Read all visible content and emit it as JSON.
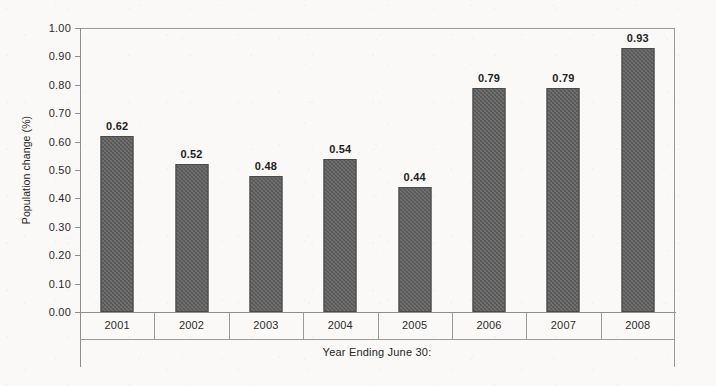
{
  "chart_data": {
    "type": "bar",
    "title": "",
    "xlabel": "Year Ending June 30:",
    "ylabel": "Population change (%)",
    "categories": [
      "2001",
      "2002",
      "2003",
      "2004",
      "2005",
      "2006",
      "2007",
      "2008"
    ],
    "values": [
      0.62,
      0.52,
      0.48,
      0.54,
      0.44,
      0.79,
      0.79,
      0.93
    ],
    "data_labels": [
      "0.62",
      "0.52",
      "0.48",
      "0.54",
      "0.44",
      "0.79",
      "0.79",
      "0.93"
    ],
    "ylim": [
      0.0,
      1.0
    ],
    "ytick_step": 0.1,
    "ytick_labels": [
      "1.00",
      "0.90",
      "0.80",
      "0.70",
      "0.60",
      "0.50",
      "0.40",
      "0.30",
      "0.20",
      "0.10",
      "0.00"
    ],
    "ytick_values": [
      1.0,
      0.9,
      0.8,
      0.7,
      0.6,
      0.5,
      0.4,
      0.3,
      0.2,
      0.1,
      0.0
    ],
    "grid": false,
    "legend": null,
    "legend_position": "none",
    "series": [
      {
        "name": "Population change",
        "values": [
          0.62,
          0.52,
          0.48,
          0.54,
          0.44,
          0.79,
          0.79,
          0.93
        ],
        "color": "#5c5c5c"
      }
    ],
    "colors": {
      "bar_fill": "#5c5c5c",
      "bar_border": "#4a4a4a",
      "axis": "#8e8e8e",
      "text": "#262626",
      "background": "#faf9f7"
    }
  }
}
